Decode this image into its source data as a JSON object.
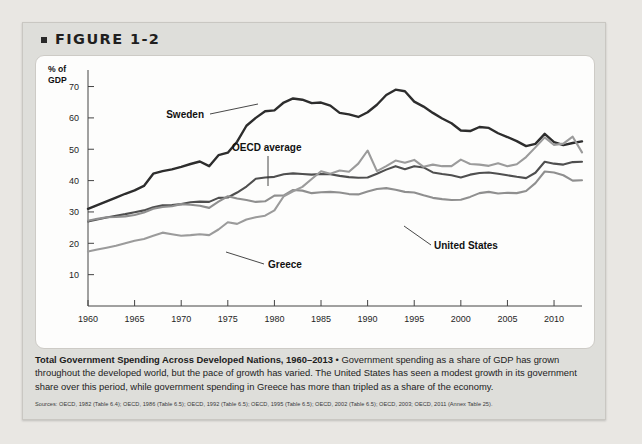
{
  "figure": {
    "bullet": "square-bullet",
    "label": "FIGURE 1-2"
  },
  "caption": {
    "title": "Total Government Spending Across Developed Nations, 1960–2013",
    "separator": " • ",
    "body": "Government spending as a share of GDP has grown throughout the developed world, but the pace of growth has varied. The United States has seen a modest growth in its government share over this period, while government spending in Greece has more than tripled as a share of the economy.",
    "sources": "Sources: OECD, 1982 (Table 6.4); OECD, 1986 (Table 6.5); OECD, 1992 (Table 6.5); OECD, 1995 (Table 6.5); OECD, 2002 (Table 6.5); OECD, 2003; OECD, 2011 (Annex Table 25)."
  },
  "chart_data": {
    "type": "line",
    "title": "Total Government Spending Across Developed Nations, 1960–2013",
    "xlabel": "",
    "ylabel": "% of GDP",
    "ylabel_lines": [
      "% of",
      "GDP"
    ],
    "xlim": [
      1960,
      2013
    ],
    "ylim": [
      0,
      74
    ],
    "yticks": [
      10,
      20,
      30,
      40,
      50,
      60,
      70
    ],
    "xticks": [
      1960,
      1965,
      1970,
      1975,
      1980,
      1985,
      1990,
      1995,
      2000,
      2005,
      2010
    ],
    "grid": false,
    "legend_position": "inline-annotations",
    "x": [
      1960,
      1961,
      1962,
      1963,
      1964,
      1965,
      1966,
      1967,
      1968,
      1969,
      1970,
      1971,
      1972,
      1973,
      1974,
      1975,
      1976,
      1977,
      1978,
      1979,
      1980,
      1981,
      1982,
      1983,
      1984,
      1985,
      1986,
      1987,
      1988,
      1989,
      1990,
      1991,
      1992,
      1993,
      1994,
      1995,
      1996,
      1997,
      1998,
      1999,
      2000,
      2001,
      2002,
      2003,
      2004,
      2005,
      2006,
      2007,
      2008,
      2009,
      2010,
      2011,
      2012,
      2013
    ],
    "series": [
      {
        "name": "Sweden",
        "color": "#2d2d2d",
        "width": 2.4,
        "values": [
          31.0,
          32.2,
          33.4,
          34.6,
          35.8,
          36.9,
          38.3,
          42.2,
          43.0,
          43.6,
          44.4,
          45.3,
          46.1,
          44.6,
          48.1,
          48.9,
          52.4,
          57.5,
          60.0,
          62.1,
          62.4,
          64.9,
          66.2,
          65.8,
          64.7,
          64.9,
          63.9,
          61.6,
          61.1,
          60.3,
          61.8,
          64.2,
          67.3,
          69.0,
          68.5,
          65.2,
          63.6,
          61.6,
          59.8,
          58.3,
          56.0,
          55.8,
          57.1,
          56.8,
          55.1,
          53.9,
          52.6,
          51.0,
          51.7,
          54.9,
          52.3,
          51.3,
          52.0,
          52.5
        ]
      },
      {
        "name": "OECD average",
        "color": "#4f4f4f",
        "width": 2.1,
        "values": [
          27.0,
          27.6,
          28.2,
          28.8,
          29.3,
          29.9,
          30.5,
          31.5,
          32.1,
          32.2,
          32.5,
          33.1,
          33.3,
          33.2,
          34.5,
          34.6,
          36.2,
          38.1,
          40.6,
          41.0,
          41.2,
          42.0,
          42.3,
          42.1,
          41.9,
          42.1,
          42.0,
          41.5,
          41.1,
          40.9,
          41.0,
          42.2,
          43.5,
          44.6,
          43.6,
          44.6,
          44.2,
          42.6,
          42.1,
          41.7,
          41.0,
          41.9,
          42.4,
          42.6,
          42.2,
          41.7,
          41.2,
          40.8,
          42.5,
          46.0,
          45.4,
          45.1,
          45.9,
          46.0
        ]
      },
      {
        "name": "United States",
        "color": "#8f8f8f",
        "width": 2.1,
        "values": [
          27.2,
          27.8,
          28.3,
          28.4,
          28.6,
          29.0,
          29.8,
          31.0,
          31.6,
          31.8,
          32.5,
          32.3,
          32.0,
          31.3,
          33.3,
          35.0,
          34.3,
          33.8,
          33.2,
          33.4,
          35.2,
          35.3,
          37.0,
          36.8,
          36.0,
          36.3,
          36.4,
          36.2,
          35.7,
          35.6,
          36.5,
          37.3,
          37.6,
          37.1,
          36.4,
          36.2,
          35.3,
          34.5,
          34.1,
          33.8,
          33.9,
          34.8,
          36.0,
          36.4,
          35.9,
          36.1,
          36.0,
          36.7,
          39.2,
          42.9,
          42.6,
          41.7,
          40.0,
          40.1
        ]
      },
      {
        "name": "Greece",
        "color": "#9b9b9b",
        "width": 2.1,
        "values": [
          17.4,
          18.0,
          18.6,
          19.2,
          20.0,
          20.8,
          21.4,
          22.4,
          23.4,
          22.9,
          22.4,
          22.6,
          22.9,
          22.6,
          24.4,
          26.7,
          26.2,
          27.6,
          28.3,
          28.8,
          30.5,
          35.0,
          36.6,
          38.0,
          40.5,
          43.0,
          42.2,
          43.2,
          42.8,
          45.4,
          49.6,
          43.0,
          44.6,
          46.4,
          45.7,
          46.6,
          44.4,
          45.1,
          44.6,
          44.6,
          46.7,
          45.3,
          45.1,
          44.7,
          45.5,
          44.6,
          45.2,
          47.5,
          50.6,
          53.8,
          51.4,
          51.8,
          54.0,
          49.0
        ]
      }
    ],
    "annotations": [
      {
        "name": "Sweden",
        "text": "Sweden"
      },
      {
        "name": "OECD average",
        "text": "OECD average"
      },
      {
        "name": "United States",
        "text": "United States"
      },
      {
        "name": "Greece",
        "text": "Greece"
      }
    ]
  }
}
